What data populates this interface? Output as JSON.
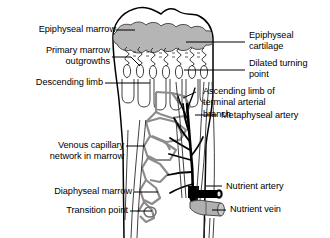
{
  "figure": {
    "type": "anatomical-diagram"
  },
  "labels": {
    "left": [
      {
        "id": "epiphyseal-marrow",
        "text": "Epiphyseal marrow"
      },
      {
        "id": "primary-marrow-outgrowths",
        "text": "Primary marrow\noutgrowths"
      },
      {
        "id": "descending-limb",
        "text": "Descending limb"
      },
      {
        "id": "venous-capillary-network",
        "text": "Venous capillary\nnetwork in marrow"
      },
      {
        "id": "diaphyseal-marrow",
        "text": "Diaphyseal marrow"
      },
      {
        "id": "transition-point",
        "text": "Transition point"
      }
    ],
    "right": [
      {
        "id": "epiphyseal-cartilage",
        "text": "Epiphyseal\ncartilage"
      },
      {
        "id": "dilated-turning-point",
        "text": "Dilated turning\npoint"
      },
      {
        "id": "ascending-limb",
        "text": "Ascending limb of\nterminal arterial\nbranch"
      },
      {
        "id": "metaphyseal-artery",
        "text": "Metaphyseal artery"
      },
      {
        "id": "nutrient-artery",
        "text": "Nutrient artery"
      },
      {
        "id": "nutrient-vein",
        "text": "Nutrient vein"
      }
    ]
  },
  "colors": {
    "outline": "#000000",
    "text": "#000000",
    "background": "#ffffff",
    "cartilage_gray": "#b5b5b5",
    "trabecula_gray": "#9a9a9a",
    "vessel_black": "#000000",
    "vein_gray": "#b0b0b0",
    "leader_line": "#000000"
  }
}
